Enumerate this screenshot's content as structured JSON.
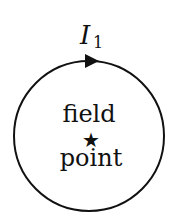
{
  "diagram": {
    "current_label": "I",
    "current_subscript": "1",
    "center_label_line1": "field",
    "center_label_line2": "point",
    "center_marker": "★",
    "loop": {
      "cx": 89,
      "cy": 136,
      "r": 75,
      "stroke": "#111111"
    },
    "arrow_direction": "clockwise"
  }
}
